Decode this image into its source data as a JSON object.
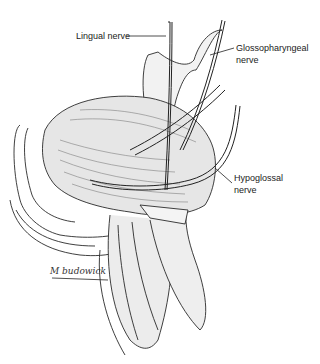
{
  "figure": {
    "labels": {
      "lingual": "Lingual nerve",
      "glossopharyngeal_line1": "Glossopharyngeal",
      "glossopharyngeal_line2": "nerve",
      "hypoglossal_line1": "Hypoglossal",
      "hypoglossal_line2": "nerve"
    },
    "signature": "M budowick",
    "colors": {
      "ink": "#222222",
      "background": "#ffffff",
      "shade": "#9a9a9a"
    }
  }
}
